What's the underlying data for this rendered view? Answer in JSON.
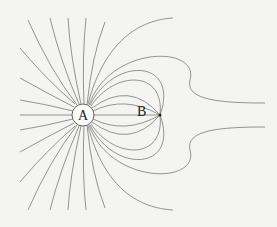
{
  "diagram": {
    "type": "electric-field-lines",
    "labels": {
      "a": "A",
      "b": "B"
    },
    "charge_a": {
      "cx": 83,
      "cy": 115,
      "r": 11
    },
    "point_b": {
      "cx": 160,
      "cy": 115
    },
    "colors": {
      "line": "#7a7a7a",
      "background": "#f4f4f2"
    }
  }
}
